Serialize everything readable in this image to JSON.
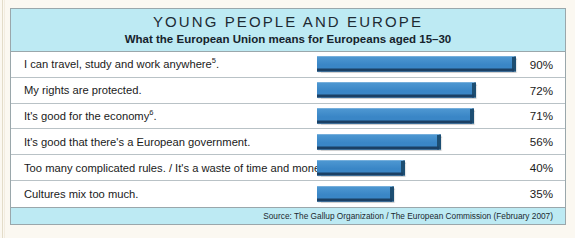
{
  "figure": {
    "title": "YOUNG PEOPLE AND EUROPE",
    "subtitle": "What the European Union means for Europeans aged 15–30",
    "source": "Source: The Gallup Organization / The European Commission (February 2007)",
    "accent_color": "#3c8ccb",
    "band_color": "#bdeaf3",
    "page_color": "#fbf8f1"
  },
  "chart_data": {
    "type": "bar",
    "orientation": "horizontal",
    "title": "YOUNG PEOPLE AND EUROPE",
    "subtitle": "What the European Union means for Europeans aged 15–30",
    "xlabel": "",
    "ylabel": "",
    "xlim": [
      0,
      100
    ],
    "grid": false,
    "legend": "none",
    "value_suffix": "%",
    "source": "Source: The Gallup Organization / The European Commission (February 2007)",
    "categories": [
      "I can travel, study and work anywhere5.",
      "My rights are protected.",
      "It's good for the economy6.",
      "It's good that there's a European government.",
      "Too many complicated rules. / It's a waste of time and money.",
      "Cultures mix too much."
    ],
    "values": [
      90,
      72,
      71,
      56,
      40,
      35
    ],
    "value_labels": [
      "90%",
      "72%",
      "71%",
      "56%",
      "40%",
      "35%"
    ]
  },
  "rows": [
    {
      "label_main": "I can travel, study and work anywhere",
      "label_sup": "5",
      "label_tail": ".",
      "value": 90,
      "value_label": "90%"
    },
    {
      "label_main": "My rights are protected.",
      "label_sup": "",
      "label_tail": "",
      "value": 72,
      "value_label": "72%"
    },
    {
      "label_main": "It's good for the economy",
      "label_sup": "6",
      "label_tail": ".",
      "value": 71,
      "value_label": "71%"
    },
    {
      "label_main": "It's good that there's a European government.",
      "label_sup": "",
      "label_tail": "",
      "value": 56,
      "value_label": "56%"
    },
    {
      "label_main": "Too many complicated rules. / It's a waste of time and money.",
      "label_sup": "",
      "label_tail": "",
      "value": 40,
      "value_label": "40%"
    },
    {
      "label_main": "Cultures mix too much.",
      "label_sup": "",
      "label_tail": "",
      "value": 35,
      "value_label": "35%"
    }
  ]
}
